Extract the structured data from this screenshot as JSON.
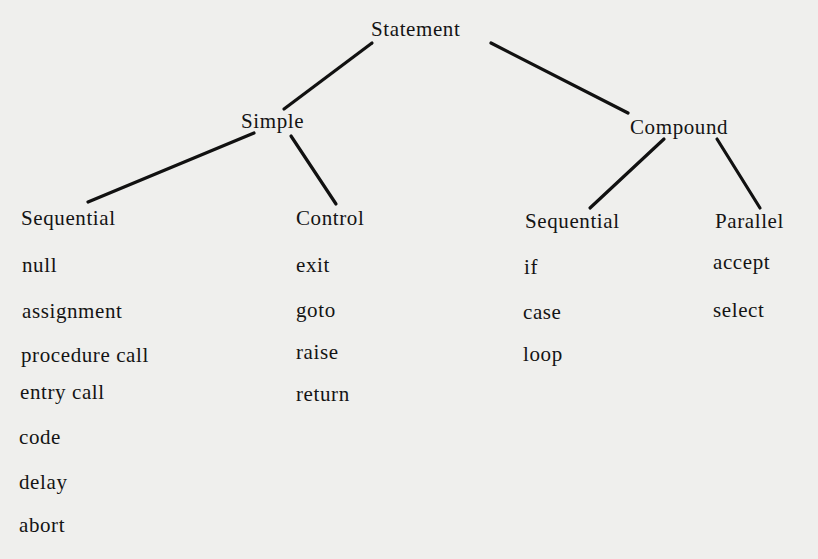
{
  "diagram": {
    "type": "tree",
    "root": "Statement",
    "level1": {
      "simple": "Simple",
      "compound": "Compound"
    },
    "level2": {
      "simple_sequential": "Sequential",
      "simple_control": "Control",
      "compound_sequential": "Sequential",
      "compound_parallel": "Parallel"
    },
    "leaves": {
      "simple_sequential": [
        "null",
        "assignment",
        "procedure call",
        "entry call",
        "code",
        "delay",
        "abort"
      ],
      "simple_control": [
        "exit",
        "goto",
        "raise",
        "return"
      ],
      "compound_sequential": [
        "if",
        "case",
        "loop"
      ],
      "compound_parallel": [
        "accept",
        "select"
      ]
    },
    "edges": [
      [
        "Statement",
        "Simple"
      ],
      [
        "Statement",
        "Compound"
      ],
      [
        "Simple",
        "Sequential"
      ],
      [
        "Simple",
        "Control"
      ],
      [
        "Compound",
        "Sequential"
      ],
      [
        "Compound",
        "Parallel"
      ]
    ]
  }
}
